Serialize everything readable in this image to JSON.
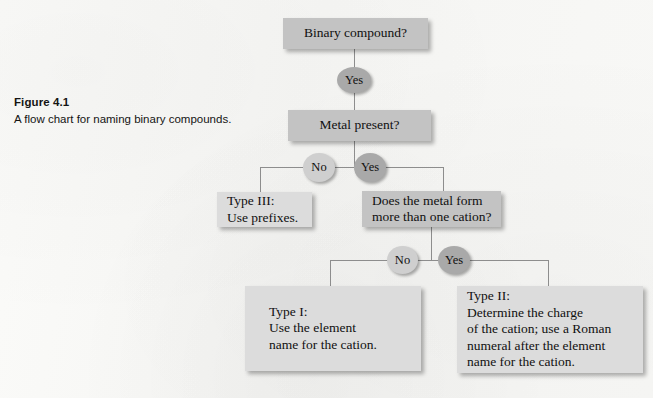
{
  "figure": {
    "caption_title": "Figure 4.1",
    "caption_text": "A flow chart for naming binary compounds."
  },
  "colors": {
    "page_background": "#f7f7f5",
    "box_fill_dark": "#c3c3c3",
    "box_fill_light": "#dcdcdc",
    "circle_fill_dark": "#a9a9a9",
    "circle_fill_pale": "#cfcfcf",
    "connector_line": "#8d8d8d",
    "text": "#101010"
  },
  "flowchart": {
    "title": "A flow chart for naming binary compounds.",
    "nodes": {
      "binary_compound": "Binary compound?",
      "yes_to_metal": "Yes",
      "metal_present": "Metal present?",
      "metal_no": "No",
      "metal_yes": "Yes",
      "type_iii": "Type III:\nUse prefixes.",
      "more_than_one_cation": "Does the metal form\nmore than one cation?",
      "cation_no": "No",
      "cation_yes": "Yes",
      "type_i": "Type I:\nUse the element\nname for the cation.",
      "type_ii": "Type II:\nDetermine the charge\nof the cation; use a Roman\nnumeral  after the element\nname for the cation."
    }
  }
}
